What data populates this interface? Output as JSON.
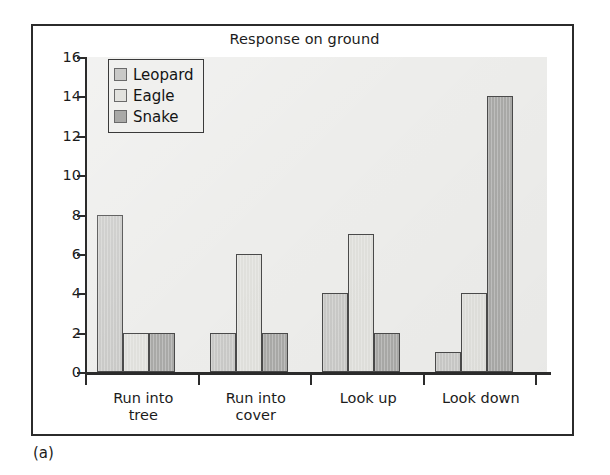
{
  "figure": {
    "label": "(a)"
  },
  "chart_data": {
    "type": "bar",
    "title": "Response on ground",
    "xlabel": "",
    "ylabel": "",
    "ylim": [
      0,
      16
    ],
    "yticks": [
      16,
      14,
      12,
      10,
      8,
      6,
      4,
      2,
      0
    ],
    "ytick_labels": [
      "16",
      "14",
      "12",
      "10",
      "8",
      "6",
      "4",
      "2",
      "0"
    ],
    "grid": false,
    "legend_position": "top-left",
    "categories": [
      "Run into tree",
      "Run into cover",
      "Look up",
      "Look down"
    ],
    "category_lines": [
      [
        "Run into",
        "tree"
      ],
      [
        "Run into",
        "cover"
      ],
      [
        "Look up",
        ""
      ],
      [
        "Look down",
        ""
      ]
    ],
    "series": [
      {
        "name": "Leopard",
        "color": "#c9c9c7",
        "values": [
          8,
          2,
          4,
          1
        ]
      },
      {
        "name": "Eagle",
        "color": "#e0e0dc",
        "values": [
          2,
          6,
          7,
          4
        ]
      },
      {
        "name": "Snake",
        "color": "#a9a9a7",
        "values": [
          2,
          2,
          2,
          14
        ]
      }
    ]
  },
  "legend": {
    "items": [
      {
        "label": "Leopard"
      },
      {
        "label": "Eagle"
      },
      {
        "label": "Snake"
      }
    ]
  },
  "colors": {
    "plot_background": "#ededeb",
    "frame": "#2b2b2b",
    "axis": "#2b2b2b",
    "bar_outline": "#4a4a4a"
  }
}
